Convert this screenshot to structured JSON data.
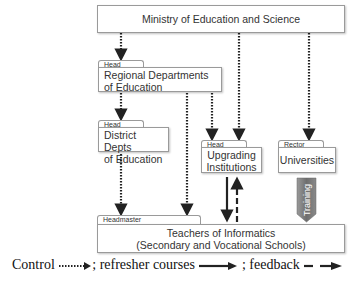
{
  "ministry": {
    "label": "Ministry of Education and Science"
  },
  "regional": {
    "tab": "Head",
    "label_line1": "Regional Departments",
    "label_line2": "of Education"
  },
  "district": {
    "tab": "Head",
    "label_line1": "District Depts",
    "label_line2": "of Education"
  },
  "upgrading": {
    "tab": "Head",
    "label_line1": "Upgrading",
    "label_line2": "Institutions"
  },
  "universities": {
    "tab": "Rector",
    "label": "Universities"
  },
  "training": {
    "label": "Training"
  },
  "teachers": {
    "tab": "Headmaster",
    "label_line1": "Teachers of Informatics",
    "label_line2": "(Secondary and Vocational Schools)"
  },
  "legend": {
    "control": "Control",
    "sep1": ";",
    "refresher": "refresher courses",
    "sep2": ";",
    "feedback": "feedback"
  },
  "colors": {
    "line": "#222222",
    "border": "#9a9a9a",
    "training_fill": "#7d7d7d"
  }
}
